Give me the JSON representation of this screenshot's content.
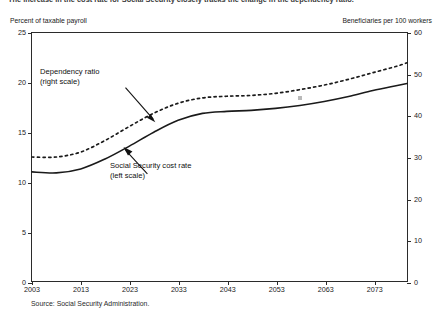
{
  "caption": "The increase in the cost rate for Social Security closely tracks the change in the dependency ratio.",
  "source_note": "Source: Social Security Administration.",
  "annotations": {
    "dependency": {
      "line1": "Dependency ratio",
      "line2": "(right scale)"
    },
    "cost": {
      "line1": "Social Security cost rate",
      "line2": "(left scale)"
    }
  },
  "chart_data": {
    "type": "line",
    "title": "The increase in the cost rate for Social Security closely tracks the change in the dependency ratio.",
    "xlabel": "",
    "ylabel": "Percent of taxable payroll",
    "y2label": "Beneficiaries per 100 workers",
    "xlim": [
      2003,
      2080
    ],
    "ylim": [
      0,
      25
    ],
    "y2lim": [
      0,
      60
    ],
    "grid": false,
    "legend": "annotations-inline",
    "xticks": [
      2003,
      2013,
      2023,
      2033,
      2043,
      2053,
      2063,
      2073
    ],
    "xticklabels": [
      "2003",
      "2013",
      "2023",
      "2033",
      "2043",
      "2053",
      "2063",
      "2073"
    ],
    "yticks": [
      0,
      5,
      10,
      15,
      20,
      25
    ],
    "yticklabels": [
      "0",
      "5",
      "10",
      "15",
      "20",
      "25"
    ],
    "y2ticks": [
      0,
      10,
      20,
      30,
      40,
      50,
      60
    ],
    "y2ticklabels": [
      "0",
      "10",
      "20",
      "30",
      "40",
      "50",
      "60"
    ],
    "x": [
      2003,
      2008,
      2013,
      2018,
      2023,
      2028,
      2033,
      2038,
      2043,
      2048,
      2053,
      2058,
      2063,
      2068,
      2073,
      2078,
      2080
    ],
    "series": [
      {
        "name": "Social Security cost rate (left scale)",
        "axis": "left",
        "style": "solid",
        "color": "#1a1a1a",
        "units": "Percent of taxable payroll",
        "values": [
          11.0,
          10.9,
          11.3,
          12.3,
          13.6,
          15.0,
          16.2,
          16.9,
          17.1,
          17.2,
          17.4,
          17.7,
          18.1,
          18.6,
          19.2,
          19.7,
          19.9
        ]
      },
      {
        "name": "Dependency ratio (right scale)",
        "axis": "right",
        "style": "dotted",
        "color": "#1a1a1a",
        "units": "Beneficiaries per 100 workers",
        "values": [
          30.0,
          30.0,
          31.2,
          34.0,
          37.4,
          40.6,
          43.0,
          44.3,
          44.7,
          44.9,
          45.4,
          46.3,
          47.4,
          48.8,
          50.4,
          52.0,
          52.8
        ]
      }
    ]
  },
  "axis_titles": {
    "left": "Percent of taxable payroll",
    "right": "Beneficiaries per 100 workers"
  }
}
